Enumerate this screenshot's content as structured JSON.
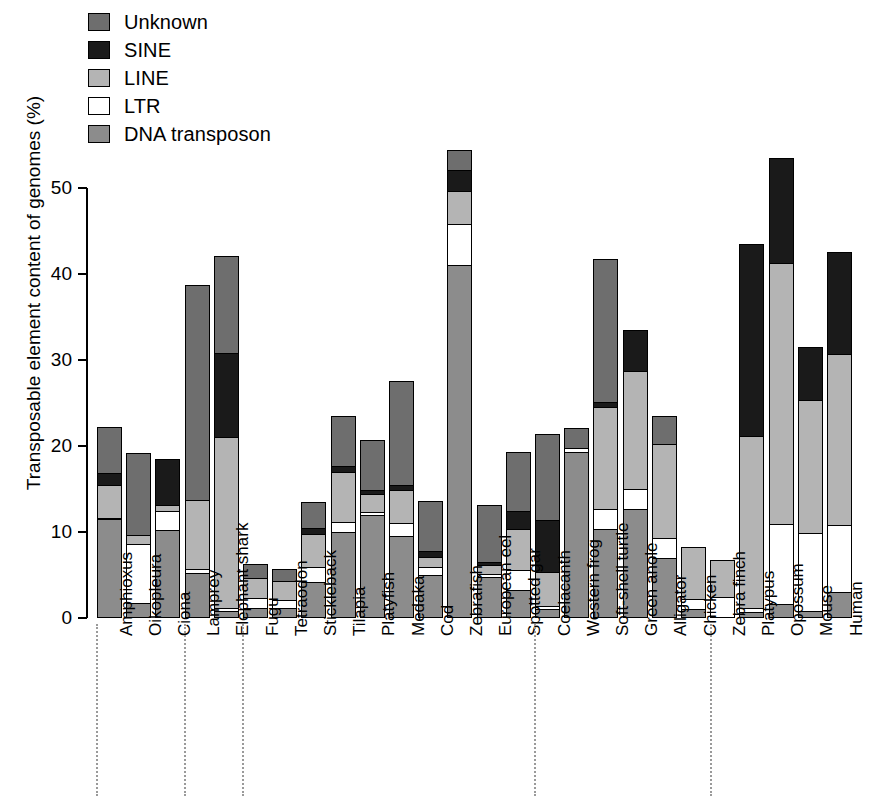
{
  "legend": {
    "items": [
      {
        "label": "Unknown",
        "color": "#6e6e6e"
      },
      {
        "label": "SINE",
        "color": "#1a1a1a"
      },
      {
        "label": "LINE",
        "color": "#b4b4b4"
      },
      {
        "label": "LTR",
        "color": "#ffffff"
      },
      {
        "label": "DNA transposon",
        "color": "#8c8c8c"
      }
    ]
  },
  "axis": {
    "y_title": "Transposable element content of genomes (%)",
    "y_ticks": [
      "0",
      "10",
      "20",
      "30",
      "40",
      "50"
    ]
  },
  "chart_data": {
    "type": "bar",
    "title": "",
    "xlabel": "",
    "ylabel": "Transposable element content of genomes (%)",
    "ylim": [
      0,
      50
    ],
    "stacked": true,
    "grid": false,
    "legend_position": "top-left",
    "categories": [
      "Amphioxus",
      "Oikopleura",
      "Ciona",
      "Lamprey",
      "Elephant shark",
      "Fugu",
      "Tetraodon",
      "Stickleback",
      "Tilapia",
      "Platyfish",
      "Medaka",
      "Cod",
      "Zebrafish",
      "European eel",
      "Spotted gar",
      "Coelacanth",
      "Western frog",
      "Soft-shell turtle",
      "Green anole",
      "Alligator",
      "Chicken",
      "Zebra finch",
      "Platypus",
      "Opossum",
      "Mouse",
      "Human"
    ],
    "series": [
      {
        "name": "DNA transposon",
        "color": "#8c8c8c",
        "values": [
          11.5,
          1.8,
          10.2,
          5.2,
          0.8,
          1.2,
          1.2,
          4.2,
          10.0,
          12.0,
          9.5,
          5.0,
          41.0,
          4.8,
          3.2,
          1.0,
          19.3,
          10.3,
          12.7,
          7.0,
          1.0,
          0.0,
          0.7,
          1.6,
          0.8,
          3.0
        ]
      },
      {
        "name": "LTR",
        "color": "#ffffff",
        "values": [
          0.3,
          7.0,
          2.4,
          0.6,
          0.5,
          1.3,
          1.1,
          1.9,
          1.3,
          0.5,
          1.7,
          1.1,
          5.0,
          0.5,
          2.5,
          0.6,
          0.6,
          2.5,
          2.5,
          2.5,
          1.4,
          2.5,
          0.6,
          9.5,
          9.2,
          8.0
        ]
      },
      {
        "name": "LINE",
        "color": "#b4b4b4",
        "values": [
          4.0,
          1.2,
          0.8,
          8.2,
          20.0,
          2.5,
          2.3,
          4.0,
          6.0,
          2.2,
          4.0,
          1.3,
          4.0,
          1.2,
          5.0,
          4.0,
          0.0,
          12.0,
          13.8,
          11.0,
          6.2,
          4.4,
          20.2,
          30.5,
          15.6,
          20.0
        ]
      },
      {
        "name": "SINE",
        "color": "#1a1a1a",
        "values": [
          1.5,
          0.0,
          5.6,
          0.0,
          10.0,
          0.0,
          0.0,
          0.8,
          0.8,
          0.6,
          0.7,
          0.8,
          2.5,
          0.5,
          2.2,
          6.3,
          0.0,
          0.8,
          5.0,
          0.0,
          0.0,
          0.0,
          22.5,
          12.4,
          6.4,
          12.0
        ]
      },
      {
        "name": "Unknown",
        "color": "#6e6e6e",
        "values": [
          5.5,
          9.7,
          0.0,
          25.2,
          11.4,
          1.7,
          1.5,
          3.2,
          6.0,
          6.0,
          12.3,
          6.0,
          2.5,
          6.8,
          7.0,
          10.1,
          2.5,
          16.7,
          0.0,
          3.5,
          0.0,
          0.0,
          0.0,
          0.0,
          0.0,
          0.0
        ]
      }
    ],
    "totals": [
      22.8,
      19.7,
      19.0,
      39.2,
      42.7,
      6.7,
      6.1,
      14.1,
      24.1,
      21.3,
      28.2,
      14.2,
      55.0,
      13.8,
      19.9,
      22.0,
      22.4,
      42.3,
      34.0,
      24.0,
      8.6,
      6.9,
      44.0,
      54.0,
      32.0,
      43.0
    ]
  }
}
